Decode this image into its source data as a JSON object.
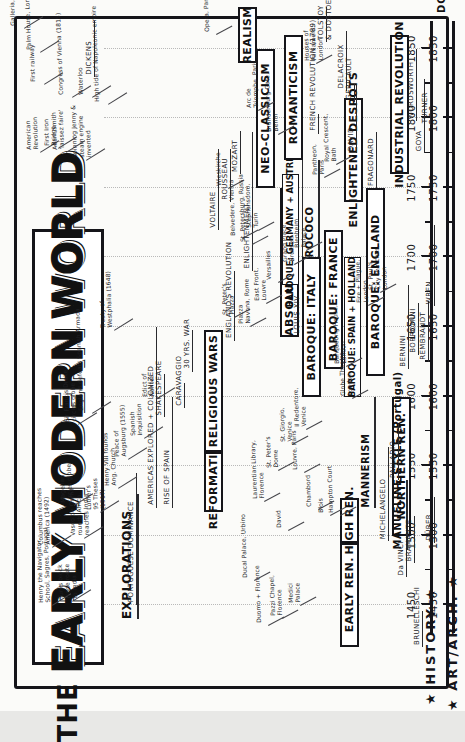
{
  "poster": {
    "title_the": "THE",
    "title_w1": "EARLY",
    "title_w2": "MODERN",
    "title_w3": "WORLD",
    "axis_end_label": "DCX"
  },
  "axis": {
    "min": 1430,
    "max": 1870,
    "major_ticks": [
      1450,
      1500,
      1550,
      1600,
      1650,
      1700,
      1750,
      1800,
      1850
    ],
    "major_labels": [
      "1450",
      "1500",
      "1550",
      "1600",
      "1650",
      "1700",
      "1750",
      "1800",
      "1850"
    ],
    "minor_step": 25
  },
  "bands": [
    {
      "name": "history",
      "label": "★ HISTORY ★"
    },
    {
      "name": "art_arch",
      "label": "★ ART/ARCH. ★"
    }
  ],
  "history": {
    "eras": [
      {
        "label": "EXPLORATIONS",
        "start": 1440,
        "end": 1530,
        "boxed": false
      },
      {
        "label": "REFORMATION",
        "start": 1517,
        "end": 1560,
        "boxed": true
      },
      {
        "label": "RELIGIOUS WARS",
        "start": 1560,
        "end": 1648,
        "boxed": true
      },
      {
        "label": "ABSOLUTE MONARCHS",
        "start": 1643,
        "end": 1750,
        "boxed": true
      },
      {
        "label": "ENLIGHTENED DESPOTS",
        "start": 1740,
        "end": 1815,
        "boxed": true
      },
      {
        "label": "INDUSTRIAL REVOLUTION",
        "start": 1760,
        "end": 1860,
        "boxed": true
      }
    ],
    "spans": [
      {
        "label": "PORTUGUESE DOMINANCE",
        "start": 1450,
        "end": 1545
      },
      {
        "label": "AMERICAS EXPLORED + COLONIZED",
        "start": 1520,
        "end": 1650
      },
      {
        "label": "RISE OF SPAIN",
        "start": 1520,
        "end": 1600
      },
      {
        "label": "30 YRS. WAR",
        "start": 1618,
        "end": 1648
      },
      {
        "label": "ENGLAND'S REVOLUTION",
        "start": 1640,
        "end": 1690
      },
      {
        "label": "ENLIGHTENMENT",
        "start": 1690,
        "end": 1790
      },
      {
        "label": "LOUIS XIV",
        "start": 1643,
        "end": 1715
      },
      {
        "label": "XV",
        "start": 1715,
        "end": 1774
      },
      {
        "label": "XVI",
        "start": 1774,
        "end": 1792
      },
      {
        "label": "FRENCH REVOLUTION (1789)",
        "start": 1789,
        "end": 1799
      }
    ],
    "events": [
      {
        "label": "Henry the Navigator,\nSchool, Sagres, Portugal",
        "year": 1450
      },
      {
        "label": "Turks block\ntrade route\nto India",
        "year": 1453
      },
      {
        "label": "Vasco de Gama\nrounds Africa,\nreaches India",
        "year": 1498
      },
      {
        "label": "Columbus reaches\nAmerica (1492)",
        "year": 1492
      },
      {
        "label": "Magellan\ncircles globe",
        "year": 1522
      },
      {
        "label": "Sir Francis Drake\ncircles globe",
        "year": 1580
      },
      {
        "label": "Luther's\n95 Theses\n(1517)",
        "year": 1517
      },
      {
        "label": "Henry VIII founds\nAng. Church",
        "year": 1534
      },
      {
        "label": "Peace of\nAugsburg (1555)",
        "year": 1555
      },
      {
        "label": "Spanish\nInquisition",
        "year": 1570
      },
      {
        "label": "Edict of\nNantes",
        "year": 1598
      },
      {
        "label": "England defeats Spanish Armada",
        "year": 1588
      },
      {
        "label": "Treaty of\nWestphalia (1648)",
        "year": 1648
      },
      {
        "label": "Congress of Vienna (1815)",
        "year": 1815
      },
      {
        "label": "Waterloo",
        "year": 1815
      },
      {
        "label": "High tide of Napoleonic empire",
        "year": 1810
      },
      {
        "label": "Adam Smith\n'laissez faire'",
        "year": 1776
      },
      {
        "label": "American\nRevolution",
        "year": 1776
      },
      {
        "label": "First Iron\nBridge",
        "year": 1779
      },
      {
        "label": "First railway",
        "year": 1825
      },
      {
        "label": "Spinning Jenny &\nsteam engine\ninvented",
        "year": 1770
      },
      {
        "label": "Galleria, Milan",
        "year": 1865
      },
      {
        "label": "Palm House, London",
        "year": 1848
      }
    ],
    "people": [
      {
        "label": "SHAKESPEARE",
        "start": 1585,
        "end": 1616
      },
      {
        "label": "CARAVAGGIO",
        "start": 1592,
        "end": 1610
      },
      {
        "label": "ROUSSEAU",
        "start": 1740,
        "end": 1778
      },
      {
        "label": "VOLTAIRE",
        "start": 1720,
        "end": 1778
      },
      {
        "label": "MOZART",
        "start": 1760,
        "end": 1791
      },
      {
        "label": "DICKENS",
        "start": 1830,
        "end": 1870
      }
    ]
  },
  "art_arch": {
    "eras": [
      {
        "label": "EARLY REN.",
        "start": 1420,
        "end": 1495,
        "boxed": true
      },
      {
        "label": "HIGH REN.",
        "start": 1495,
        "end": 1527,
        "boxed": true
      },
      {
        "label": "MANNERISM",
        "start": 1520,
        "end": 1600,
        "boxed": false
      },
      {
        "label": "BAROQUE: ITALY",
        "start": 1600,
        "end": 1700,
        "boxed": true
      },
      {
        "label": "BAROQUE: FRANCE",
        "start": 1620,
        "end": 1720,
        "boxed": true
      },
      {
        "label": "BAROQUE: SPAIN + HOLLAND",
        "start": 1600,
        "end": 1700,
        "boxed": true
      },
      {
        "label": "BAROQUE: ENGLAND",
        "start": 1615,
        "end": 1750,
        "boxed": true
      },
      {
        "label": "BAROQUE: GERMANY + AUSTRIA",
        "start": 1680,
        "end": 1760,
        "boxed": true
      },
      {
        "label": "ROCOCO",
        "start": 1700,
        "end": 1770,
        "boxed": false
      },
      {
        "label": "NORTHERN REN.",
        "start": 1500,
        "end": 1600,
        "boxed": true
      },
      {
        "label": "NEO-CLASSICISM",
        "start": 1750,
        "end": 1850,
        "boxed": true
      },
      {
        "label": "ROMANTICISM",
        "start": 1770,
        "end": 1860,
        "boxed": true
      },
      {
        "label": "REALISM",
        "start": 1840,
        "end": 1880,
        "boxed": true
      },
      {
        "label": "MANUELINE STYLE (Portugal)",
        "start": 1490,
        "end": 1540,
        "boxed": false
      }
    ],
    "artists": [
      {
        "label": "BRUNELLESCHI",
        "start": 1420,
        "end": 1446
      },
      {
        "label": "Da VINCI",
        "start": 1470,
        "end": 1519
      },
      {
        "label": "BRAMANTE",
        "start": 1480,
        "end": 1514
      },
      {
        "label": "MICHELANGELO",
        "start": 1496,
        "end": 1564
      },
      {
        "label": "PALLADIO",
        "start": 1540,
        "end": 1580
      },
      {
        "label": "DÜRER",
        "start": 1495,
        "end": 1528
      },
      {
        "label": "BERNINI",
        "start": 1620,
        "end": 1680
      },
      {
        "label": "BORROMINI",
        "start": 1630,
        "end": 1667
      },
      {
        "label": "REMBRANDT",
        "start": 1625,
        "end": 1669
      },
      {
        "label": "WREN",
        "start": 1665,
        "end": 1723
      },
      {
        "label": "FRAGONARD",
        "start": 1750,
        "end": 1790
      },
      {
        "label": "DAVID",
        "start": 1775,
        "end": 1825
      },
      {
        "label": "DELACROIX",
        "start": 1820,
        "end": 1863
      },
      {
        "label": "GERICAULT",
        "start": 1812,
        "end": 1824
      },
      {
        "label": "GOYA",
        "start": 1775,
        "end": 1828
      },
      {
        "label": "TURNER",
        "start": 1795,
        "end": 1851
      },
      {
        "label": "WORDSWORTH",
        "start": 1798,
        "end": 1850
      },
      {
        "label": "TOLSTOY\n& DOSTOEVSKI",
        "start": 1855,
        "end": 1880
      }
    ],
    "works": [
      {
        "label": "Duomo + Florence",
        "year": 1436
      },
      {
        "label": "Pazzi Chapel,\nFlorence",
        "year": 1441
      },
      {
        "label": "Medici\nPalace",
        "year": 1450
      },
      {
        "label": "David",
        "year": 1504
      },
      {
        "label": "Ducal Palace, Urbino",
        "year": 1468
      },
      {
        "label": "Laurentian Library,\nFlorence",
        "year": 1525
      },
      {
        "label": "St. Peter's\nDome",
        "year": 1547
      },
      {
        "label": "St. Giorgio,\nVenice",
        "year": 1566
      },
      {
        "label": "Il Redentore,\nVenice",
        "year": 1577
      },
      {
        "label": "Chambord",
        "year": 1519
      },
      {
        "label": "Blois",
        "year": 1515
      },
      {
        "label": "Louvre, Paris",
        "year": 1546
      },
      {
        "label": "Hampton Court",
        "year": 1515
      },
      {
        "label": "Globe Theatre,\nLondon",
        "year": 1599
      },
      {
        "label": "Banqueting House,\nLondon",
        "year": 1622
      },
      {
        "label": "St. Peter's\nPiazza",
        "year": 1657
      },
      {
        "label": "Piazza\nNavona, Rome",
        "year": 1651
      },
      {
        "label": "East Front,\nLouvre",
        "year": 1667
      },
      {
        "label": "Versailles",
        "year": 1682
      },
      {
        "label": "Grand Place,\nBrussels",
        "year": 1695
      },
      {
        "label": "Fire + Plague,\nLondon",
        "year": 1666
      },
      {
        "label": "St. Paul's,\nCity churches,\nLondon",
        "year": 1675
      },
      {
        "label": "Blenheim\nPalace",
        "year": 1705
      },
      {
        "label": "Belvedere, Vienna",
        "year": 1714
      },
      {
        "label": "Stephansdom,\nTurin",
        "year": 1720
      },
      {
        "label": "Wieskirche",
        "year": 1750
      },
      {
        "label": "St. Petersburg, Russia",
        "year": 1710
      },
      {
        "label": "Pantheon,\nParis",
        "year": 1758
      },
      {
        "label": "Royal Crescent,\nBath",
        "year": 1767
      },
      {
        "label": "Brandenburg Gate,\nBerlin",
        "year": 1789
      },
      {
        "label": "Arc de\nTriomphe, Paris",
        "year": 1806
      },
      {
        "label": "Houses of\nParliament,\nLondon",
        "year": 1840
      },
      {
        "label": "Opera, Paris",
        "year": 1861
      }
    ]
  }
}
